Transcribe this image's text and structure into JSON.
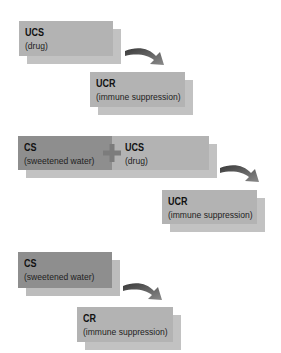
{
  "colors": {
    "light_box": "#b3b3b3",
    "light_box_shadow": "#c2c2c2",
    "dark_box": "#8e8e8e",
    "arrow": "#555555",
    "plus": "#7a7a7a"
  },
  "panels": [
    {
      "stimulus": [
        {
          "title": "UCS",
          "subtitle": "(drug)",
          "tone": "light"
        }
      ],
      "arrow_icon": "curved-arrow-icon",
      "response": {
        "title": "UCR",
        "subtitle": "(immune suppression)",
        "tone": "light"
      }
    },
    {
      "stimulus": [
        {
          "title": "CS",
          "subtitle": "(sweetened water)",
          "tone": "dark"
        },
        {
          "title": "UCS",
          "subtitle": "(drug)",
          "tone": "light"
        }
      ],
      "operator_icon": "plus-icon",
      "arrow_icon": "curved-arrow-icon",
      "response": {
        "title": "UCR",
        "subtitle": "(immune suppression)",
        "tone": "light"
      }
    },
    {
      "stimulus": [
        {
          "title": "CS",
          "subtitle": "(sweetened water)",
          "tone": "dark"
        }
      ],
      "arrow_icon": "curved-arrow-icon",
      "response": {
        "title": "CR",
        "subtitle": "(immune suppression)",
        "tone": "light"
      }
    }
  ]
}
